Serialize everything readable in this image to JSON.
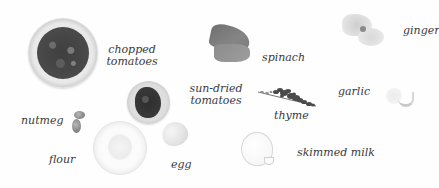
{
  "page": {
    "type": "ingredient-illustration",
    "background_color": "#fefefe",
    "text_color": "#3a3a3a"
  },
  "ingredients": {
    "chopped_tomatoes": {
      "line1": "chopped",
      "line2": "tomatoes",
      "image": "bowl-of-chopped-tomatoes"
    },
    "spinach": {
      "label": "spinach",
      "image": "spinach-leaves"
    },
    "ginger": {
      "label": "ginger",
      "image": "ginger-root"
    },
    "sun_dried_tomatoes": {
      "line1": "sun-dried",
      "line2": "tomatoes",
      "image": "bowl-of-sun-dried-tomatoes"
    },
    "garlic": {
      "label": "garlic",
      "image": "garlic-cloves"
    },
    "thyme": {
      "label": "thyme",
      "image": "thyme-sprig"
    },
    "nutmeg": {
      "label": "nutmeg",
      "image": "whole-nutmegs"
    },
    "flour": {
      "label": "flour",
      "image": "bowl-of-flour"
    },
    "egg": {
      "label": "egg",
      "image": "egg"
    },
    "skimmed_milk": {
      "label": "skimmed milk",
      "image": "jug-of-milk"
    }
  }
}
